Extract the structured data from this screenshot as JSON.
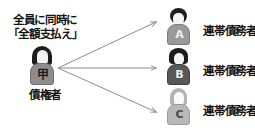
{
  "diagram": {
    "title_text": "",
    "creditor": {
      "demand_line1": "全員に同時に",
      "demand_line2": "「全額支払え」",
      "badge": "甲",
      "label": "債権者",
      "avatar_icon": "person-dark-hair-icon"
    },
    "debtors": [
      {
        "letter": "A",
        "label": "連帯債務者",
        "avatar_icon": "person-round-hair-icon"
      },
      {
        "letter": "B",
        "label": "連帯債務者",
        "avatar_icon": "person-short-hair-icon"
      },
      {
        "letter": "C",
        "label": "連帯債務者",
        "avatar_icon": "person-long-hair-icon"
      }
    ],
    "arrows": [
      {
        "name": "arrow-to-debtor-a"
      },
      {
        "name": "arrow-to-debtor-b"
      },
      {
        "name": "arrow-to-debtor-c"
      }
    ],
    "colors": {
      "text": "#141414",
      "arrow": "#8d8d8d",
      "background": "#ffffff",
      "body_a": "#9a9a9a",
      "body_b": "#585858",
      "body_c": "#b9b9b9",
      "body_creditor": "#8e8e8e"
    }
  }
}
